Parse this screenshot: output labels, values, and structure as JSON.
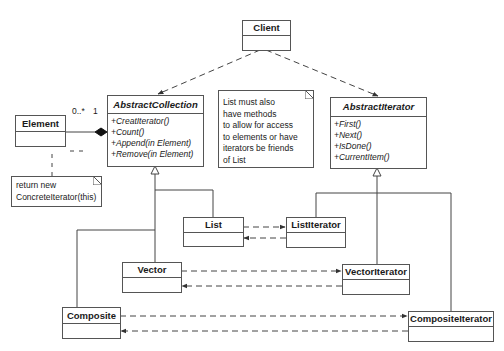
{
  "diagram": {
    "type": "uml-class-diagram",
    "classes": {
      "client": {
        "name": "Client"
      },
      "abstract_collection": {
        "name": "AbstractCollection",
        "operations": [
          "+CreatIterator()",
          "+Count()",
          "+Append(in Element)",
          "+Remove(in Element)"
        ]
      },
      "abstract_iterator": {
        "name": "AbstractIterator",
        "operations": [
          "+First()",
          "+Next()",
          "+IsDone()",
          "+CurrentItem()"
        ]
      },
      "element": {
        "name": "Element"
      },
      "list": {
        "name": "List"
      },
      "list_iterator": {
        "name": "ListIterator"
      },
      "vector": {
        "name": "Vector"
      },
      "vector_iterator": {
        "name": "VectorIterator"
      },
      "composite": {
        "name": "Composite"
      },
      "composite_iterator": {
        "name": "CompositeIterator"
      }
    },
    "notes": {
      "friends_note": {
        "lines": [
          "List must also",
          "have methods",
          "to allow for access",
          "to elements or have",
          "iterators be friends",
          "of List"
        ]
      },
      "create_note": {
        "lines": [
          "return new",
          "ConcreteIterator(this)"
        ]
      }
    },
    "multiplicities": {
      "element_end": "0..*",
      "collection_end": "1"
    }
  }
}
